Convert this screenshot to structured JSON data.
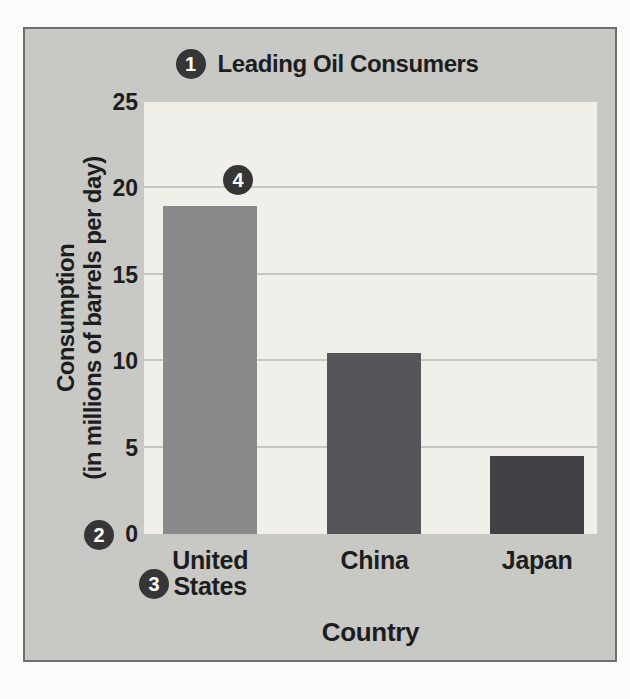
{
  "figure": {
    "callouts": [
      "1",
      "2",
      "3",
      "4"
    ]
  },
  "chart_data": {
    "type": "bar",
    "title": "Leading Oil Consumers",
    "xlabel": "Country",
    "ylabel": "Consumption (in millions of barrels per day)",
    "ylabel_display": [
      "Consumption",
      "(in millions of barrels per day)"
    ],
    "categories": [
      "United States",
      "China",
      "Japan"
    ],
    "categories_display": [
      [
        "United",
        "States"
      ],
      [
        "China"
      ],
      [
        "Japan"
      ]
    ],
    "values": [
      19,
      10.5,
      4.5
    ],
    "ylim": [
      0,
      25
    ],
    "yticks": [
      25,
      20,
      15,
      10,
      5,
      0
    ],
    "gridlines": [
      20,
      15,
      10,
      5
    ],
    "bar_colors": [
      "#8a8a8d",
      "#56565a",
      "#424246"
    ],
    "grid": "horizontal",
    "legend": "none"
  },
  "colors": {
    "page_bg": "#fbfbf9",
    "card_bg": "#c8c8c5",
    "card_border": "#6e6e6e",
    "plot_bg": "#f0efe9",
    "gridline": "#c6c6c2",
    "text": "#1d1d1f",
    "badge_bg": "#363636",
    "badge_text": "#ffffff"
  }
}
